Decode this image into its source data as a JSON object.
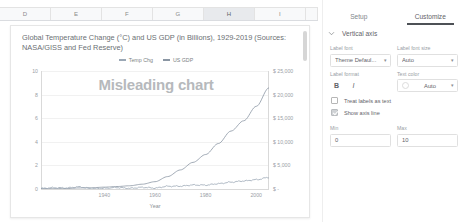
{
  "spreadsheet": {
    "columns": [
      {
        "label": "D",
        "selected": false
      },
      {
        "label": "E",
        "selected": false
      },
      {
        "label": "F",
        "selected": false
      },
      {
        "label": "G",
        "selected": false
      },
      {
        "label": "H",
        "selected": true
      },
      {
        "label": "I",
        "selected": false
      }
    ]
  },
  "chart_card": {
    "watermark": "Misleading chart"
  },
  "chart_data": {
    "type": "line",
    "title": "Global Temperature Change (°C) and US GDP (in Billions), 1929-2019 (Sources: NASA/GISS and Fed Reserve)",
    "xlabel": "Year",
    "ylabel": "",
    "grid": true,
    "legend_position": "top-center",
    "xlim": [
      1929,
      2019
    ],
    "xticks": [
      "1940",
      "1960",
      "1980",
      "2000"
    ],
    "xtick_values": [
      1940,
      1960,
      1980,
      2000
    ],
    "left_axis": {
      "ylim": [
        0,
        10
      ],
      "ticks": [
        "10",
        "8",
        "6",
        "4",
        "2",
        "0"
      ],
      "tick_values": [
        10,
        8,
        6,
        4,
        2,
        0
      ]
    },
    "right_axis": {
      "ylim": [
        0,
        25000
      ],
      "ticks": [
        "$ 25,000",
        "$ 20,000",
        "$ 15,000",
        "$ 10,000",
        "$ 5,000",
        "$ -"
      ],
      "tick_values": [
        25000,
        20000,
        15000,
        10000,
        5000,
        0
      ]
    },
    "series": [
      {
        "name": "Temp Chg",
        "color": "#9aa7b5",
        "axis": "left",
        "x": [
          1929,
          1934,
          1939,
          1944,
          1949,
          1954,
          1959,
          1964,
          1969,
          1974,
          1979,
          1984,
          1989,
          1994,
          1999,
          2004,
          2009,
          2014,
          2019
        ],
        "values": [
          0.05,
          0.11,
          0.09,
          0.18,
          0.03,
          0.06,
          0.12,
          0.06,
          0.14,
          0.08,
          0.23,
          0.24,
          0.34,
          0.33,
          0.45,
          0.58,
          0.68,
          0.79,
          0.98
        ]
      },
      {
        "name": "US GDP",
        "color": "#8a96a3",
        "axis": "right",
        "x": [
          1929,
          1934,
          1939,
          1944,
          1949,
          1954,
          1959,
          1964,
          1969,
          1974,
          1979,
          1984,
          1989,
          1994,
          1999,
          2004,
          2009,
          2014,
          2019
        ],
        "values": [
          104,
          67,
          93,
          224,
          272,
          391,
          523,
          685,
          1019,
          1549,
          2632,
          4038,
          5642,
          7309,
          9631,
          12274,
          14449,
          17522,
          21433
        ]
      }
    ]
  },
  "panel": {
    "tabs": [
      {
        "label": "Setup",
        "active": false
      },
      {
        "label": "Customize",
        "active": true
      }
    ],
    "section": {
      "title": "Vertical axis",
      "expanded": true
    },
    "label_font": {
      "label": "Label font",
      "value": "Theme Defaul..."
    },
    "label_font_size": {
      "label": "Label font size",
      "value": "Auto"
    },
    "label_format": {
      "label": "Label format",
      "bold": "B",
      "italic": "I"
    },
    "text_color": {
      "label": "Text color",
      "value": "Auto"
    },
    "checkboxes": [
      {
        "label": "Treat labels as text",
        "checked": false
      },
      {
        "label": "Show axis line",
        "checked": true
      }
    ],
    "min": {
      "label": "Min",
      "value": "0"
    },
    "max": {
      "label": "Max",
      "value": "10"
    }
  }
}
